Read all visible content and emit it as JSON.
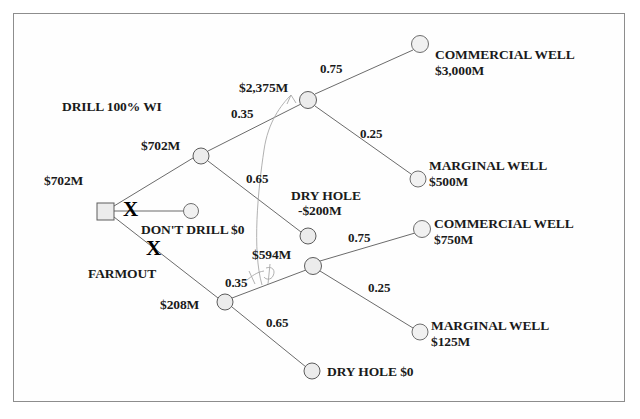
{
  "diagram": {
    "type": "decision-tree",
    "root_value": "$702M",
    "nodes": {
      "root_decision": {
        "label": "",
        "value": "$702M",
        "shape": "square"
      },
      "drill_chance": {
        "label": "DRILL 100% WI",
        "value": "$702M"
      },
      "dont_drill_end": {
        "label": "DON'T DRILL $0",
        "value": "$0"
      },
      "farmout_chance": {
        "label": "FARMOUT",
        "value": "$208M"
      },
      "drill_success": {
        "value": "$2,375M"
      },
      "drill_dryhole": {
        "label": "DRY HOLE",
        "value": "-$200M"
      },
      "farmout_success": {
        "value": "$594M"
      },
      "farmout_dryhole": {
        "label": "DRY HOLE $0",
        "value": "$0"
      }
    },
    "branch_labels": {
      "drill": "DRILL 100% WI",
      "dont_drill": "DON'T DRILL $0",
      "farmout": "FARMOUT"
    },
    "eliminated_marks": [
      "X",
      "X"
    ],
    "probabilities": {
      "drill_success": "0.35",
      "drill_dryhole": "0.65",
      "drill_commercial": "0.75",
      "drill_marginal": "0.25",
      "farmout_success": "0.35",
      "farmout_dryhole": "0.65",
      "farmout_commercial": "0.75",
      "farmout_marginal": "0.25"
    },
    "values": {
      "root": "$702M",
      "drill_node": "$702M",
      "drill_success_node": "$2,375M",
      "drill_dryhole_value": "-$200M",
      "farmout_node": "$208M",
      "farmout_success_node": "$594M"
    },
    "outcomes": [
      {
        "id": "drill-commercial",
        "name": "COMMERCIAL WELL",
        "amount": "$3,000M"
      },
      {
        "id": "drill-marginal",
        "name": "MARGINAL WELL",
        "amount": "$500M"
      },
      {
        "id": "drill-dryhole",
        "name": "DRY HOLE",
        "amount": "-$200M"
      },
      {
        "id": "farmout-commercial",
        "name": "COMMERCIAL WELL",
        "amount": "$750M"
      },
      {
        "id": "farmout-marginal",
        "name": "MARGINAL WELL",
        "amount": "$125M"
      },
      {
        "id": "farmout-dryhole",
        "name": "DRY HOLE $0",
        "amount": ""
      }
    ],
    "colors": {
      "node_fill": "#ececec",
      "node_stroke": "#5c5c5c",
      "edge": "#6b6b6b",
      "text": "#1a1a1a",
      "frame": "#8d8d8d",
      "annotation": "#9a9a9a"
    }
  }
}
